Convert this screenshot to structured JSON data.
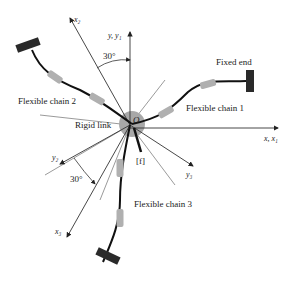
{
  "diagram": {
    "labels": {
      "fixed_end": "Fixed end",
      "chain1": "Flexible chain 1",
      "chain2": "Flexible chain 2",
      "chain3": "Flexible chain 3",
      "rigid_link": "Rigid link",
      "origin": "O",
      "frame": "[f]",
      "angle_top": "30°",
      "angle_bottom": "30°"
    },
    "axes": {
      "y_y1": "y, y₁",
      "x_x1": "x, x₁",
      "x2": "x₂",
      "y2": "y₂",
      "x3": "x₃",
      "y3": "y₃"
    },
    "colors": {
      "hub": "#a8a8a8",
      "chain": "#111111",
      "segment": "#b0b0b0",
      "anchor": "#2a2a2a",
      "axis": "#333333"
    }
  }
}
